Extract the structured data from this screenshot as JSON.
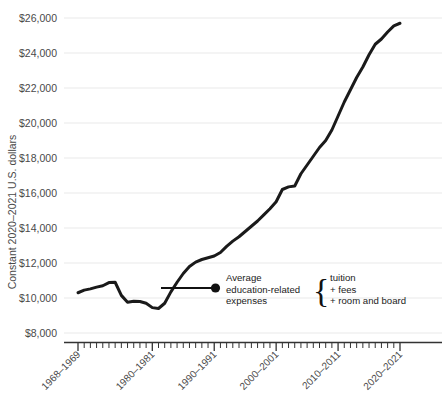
{
  "chart_data": {
    "type": "line",
    "title": "",
    "subtitle": "",
    "xlabel": "",
    "ylabel": "Constant 2020–2021 U.S. dollars",
    "ylim": [
      8000,
      26000
    ],
    "ytick_step": 2000,
    "grid": true,
    "legend_position": "none",
    "line_color": "#1a1a1a",
    "grid_color": "#e9e9e9",
    "axis_color": "#333333",
    "ytick_labels": [
      "$26,000",
      "$24,000",
      "$22,000",
      "$20,000",
      "$18,000",
      "$16,000",
      "$14,000",
      "$12,000",
      "$10,000",
      "$8,000"
    ],
    "ytick_values": [
      26000,
      24000,
      22000,
      20000,
      18000,
      16000,
      14000,
      12000,
      10000,
      8000
    ],
    "xtick_labels": [
      "1968–1969",
      "1980–1981",
      "1990–1991",
      "2000–2001",
      "2010–2011",
      "2020–2021"
    ],
    "xtick_indices": [
      0,
      12,
      22,
      32,
      42,
      52
    ],
    "categories": [
      "1968–1969",
      "1969–1970",
      "1970–1971",
      "1971–1972",
      "1972–1973",
      "1973–1974",
      "1974–1975",
      "1975–1976",
      "1976–1977",
      "1977–1978",
      "1978–1979",
      "1979–1980",
      "1980–1981",
      "1981–1982",
      "1982–1983",
      "1983–1984",
      "1984–1985",
      "1985–1986",
      "1986–1987",
      "1987–1988",
      "1988–1989",
      "1989–1990",
      "1990–1991",
      "1991–1992",
      "1992–1993",
      "1993–1994",
      "1994–1995",
      "1995–1996",
      "1996–1997",
      "1997–1998",
      "1998–1999",
      "1999–2000",
      "2000–2001",
      "2001–2002",
      "2002–2003",
      "2003–2004",
      "2004–2005",
      "2005–2006",
      "2006–2007",
      "2007–2008",
      "2008–2009",
      "2009–2010",
      "2010–2011",
      "2011–2012",
      "2012–2013",
      "2013–2014",
      "2014–2015",
      "2015–2016",
      "2016–2017",
      "2017–2018",
      "2018–2019",
      "2019–2020",
      "2020–2021"
    ],
    "values": [
      10300,
      10450,
      10520,
      10620,
      10700,
      10880,
      10900,
      10150,
      9760,
      9820,
      9800,
      9700,
      9450,
      9400,
      9700,
      10350,
      10900,
      11400,
      11800,
      12050,
      12200,
      12300,
      12400,
      12600,
      12950,
      13250,
      13500,
      13800,
      14100,
      14400,
      14750,
      15100,
      15500,
      16200,
      16350,
      16400,
      17100,
      17600,
      18100,
      18600,
      19000,
      19600,
      20400,
      21200,
      21900,
      22600,
      23200,
      23900,
      24500,
      24800,
      25200,
      25550,
      25700
    ],
    "annotation": {
      "label_line1": "Average",
      "label_line2": "education-related",
      "label_line3": "expenses",
      "brace": "{",
      "components": [
        "tuition",
        "+ fees",
        "+ room and board"
      ]
    }
  }
}
